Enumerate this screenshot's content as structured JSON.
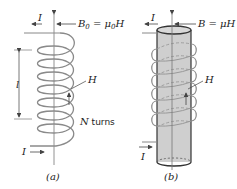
{
  "figure_a": {
    "current_top_label": "I",
    "field_label_prefix": "B",
    "field_label_sub": "0",
    "field_label_eq": " = μ",
    "field_label_sub2": "0",
    "field_label_suffix": "H",
    "length_label": "l",
    "h_label": "H",
    "turns_label_N": "N",
    "turns_label_text": " turns",
    "current_bottom_label": "I",
    "caption": "(a)"
  },
  "figure_b": {
    "current_top_label": "I",
    "field_label": "B = μH",
    "h_label": "H",
    "current_bottom_label": "I",
    "caption": "(b)"
  },
  "colors": {
    "coil": "#8a8a8a",
    "core_fill": "#cfcfcf",
    "core_edge": "#333333",
    "axis": "#666666"
  }
}
